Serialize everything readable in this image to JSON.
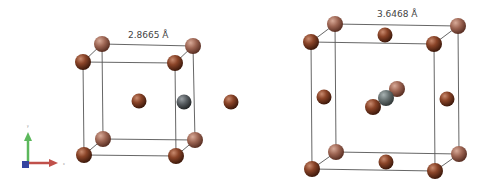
{
  "left_cell": {
    "lattice_label": "2.8665 Å",
    "structure": "body-centered cubic",
    "colors": {
      "host_atom": "#7a3a22",
      "host_atom_back": "#9a6050",
      "solute_atom": "#505558",
      "edge": "#555555"
    }
  },
  "right_cell": {
    "lattice_label": "3.6468 Å",
    "structure": "face-centered cubic",
    "colors": {
      "host_atom": "#7a3a22",
      "host_atom_back": "#9a6050",
      "solute_atom": "#606a6a",
      "edge": "#555555"
    }
  },
  "axes_triad": {
    "x_label": "x",
    "y_label": "y",
    "x_color": "#c0392b",
    "y_color": "#4caf50",
    "z_color": "#3545a0"
  }
}
